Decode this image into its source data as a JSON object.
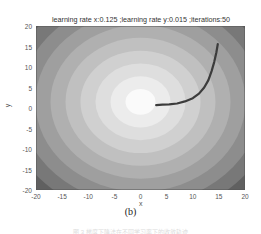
{
  "chart_data": {
    "type": "contour",
    "title": "learning rate x:0.125 ;learning rate y:0.015 ;iterations:50",
    "xlabel": "x",
    "ylabel": "y",
    "xlim": [
      -20,
      20
    ],
    "ylim": [
      -20,
      20
    ],
    "xticks": [
      "-20",
      "-15",
      "-10",
      "-5",
      "0",
      "5",
      "10",
      "15",
      "20"
    ],
    "yticks": [
      "20",
      "15",
      "10",
      "5",
      "0",
      "-5",
      "-10",
      "-15",
      "-20"
    ],
    "grid": false,
    "colormap": "gray",
    "contour_center": [
      0,
      1.5
    ],
    "contour_levels": 10,
    "trajectory": {
      "iterations": 50,
      "start": [
        14.8,
        15.6
      ],
      "end": [
        3.0,
        0.7
      ],
      "points": [
        [
          14.8,
          15.6
        ],
        [
          14.5,
          13.5
        ],
        [
          14.1,
          11.2
        ],
        [
          13.6,
          9.0
        ],
        [
          13.0,
          6.8
        ],
        [
          12.2,
          5.0
        ],
        [
          11.2,
          3.5
        ],
        [
          10.0,
          2.4
        ],
        [
          8.5,
          1.6
        ],
        [
          7.0,
          1.1
        ],
        [
          5.5,
          0.9
        ],
        [
          4.2,
          0.8
        ],
        [
          3.0,
          0.7
        ]
      ]
    },
    "colors": {
      "center": "#fafafa",
      "edge": "#3a3a3a",
      "path": "#3c3c3c"
    }
  },
  "subfigure_label": "(b)",
  "caption": "图 3  梯度下降法在不同学习率下的收敛轨迹"
}
